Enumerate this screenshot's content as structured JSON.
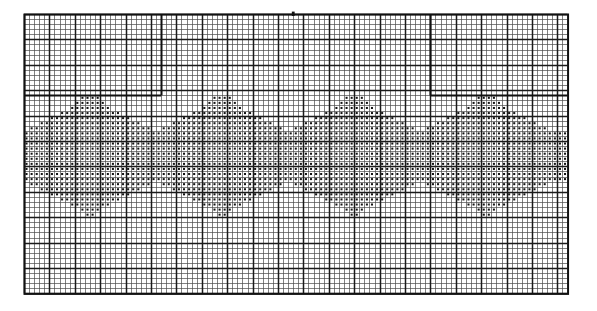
{
  "document": {
    "kind": "filet-crochet-pattern-chart",
    "title": "Filet Crochet Border Pattern Chart",
    "description": "Graph-paper chart showing a repeating scalloped arch border motif rendered as filled squares on a ruled grid."
  },
  "grid": {
    "origin_x": 24,
    "origin_y": 14,
    "cell_size": 5.08,
    "columns": 107,
    "rows": 55,
    "minor_line_color": "#4a4a4a",
    "minor_line_width": 0.7,
    "major_line_color": "#1a1a1a",
    "major_line_width": 1.5,
    "major_every": 5,
    "border_color": "#111111",
    "border_width": 2.0,
    "background_color": "#ffffff"
  },
  "symbols": {
    "filled_cell_color": "#141414",
    "filled_cell_inset": 0.3,
    "empty_cell_color": "#ffffff"
  },
  "guides": {
    "description": "Extra-heavy panel rules dividing the chart into repeat sections",
    "vertical_rules": [
      {
        "name": "panel-rule-left",
        "col": 27,
        "row_start": 0,
        "row_end": 16
      },
      {
        "name": "panel-rule-right",
        "col": 80,
        "row_start": 0,
        "row_end": 16
      }
    ],
    "horizontal_rules": [
      {
        "name": "panel-rule-top-left",
        "row": 16,
        "col_start": 0,
        "col_end": 27
      },
      {
        "name": "panel-rule-top-right",
        "row": 16,
        "col_start": 80,
        "col_end": 107
      }
    ],
    "center_tick": {
      "name": "center-mark",
      "col": 53,
      "row": 0
    }
  },
  "chart_data": {
    "type": "heatmap",
    "subtitle": "Repeating scalloped arch motif",
    "xlabel": "stitch column",
    "ylabel": "row",
    "grid": true,
    "legend": "none",
    "x": 107,
    "y": 55,
    "categories": [
      "empty",
      "filled"
    ],
    "values": [
      0,
      1
    ],
    "motif": {
      "repeat_width": 26,
      "repeats": 4,
      "repeat_start_col": 2,
      "top_row": 16,
      "bottom_row": 41
    },
    "pattern_rows": [
      {
        "row": 16,
        "spans": [
          [
            11,
            14
          ],
          [
            37,
            40
          ],
          [
            63,
            66
          ],
          [
            89,
            92
          ]
        ]
      },
      {
        "row": 17,
        "spans": [
          [
            10,
            15
          ],
          [
            36,
            41
          ],
          [
            62,
            67
          ],
          [
            88,
            93
          ]
        ]
      },
      {
        "row": 18,
        "spans": [
          [
            9,
            16
          ],
          [
            35,
            42
          ],
          [
            61,
            68
          ],
          [
            87,
            94
          ]
        ]
      },
      {
        "row": 19,
        "spans": [
          [
            7,
            18
          ],
          [
            33,
            44
          ],
          [
            59,
            70
          ],
          [
            85,
            96
          ]
        ]
      },
      {
        "row": 20,
        "spans": [
          [
            5,
            20
          ],
          [
            31,
            46
          ],
          [
            57,
            72
          ],
          [
            83,
            98
          ]
        ]
      },
      {
        "row": 21,
        "spans": [
          [
            3,
            22
          ],
          [
            29,
            48
          ],
          [
            55,
            74
          ],
          [
            81,
            100
          ]
        ]
      },
      {
        "row": 22,
        "spans": [
          [
            1,
            24
          ],
          [
            27,
            50
          ],
          [
            53,
            76
          ],
          [
            79,
            102
          ]
        ]
      },
      {
        "row": 23,
        "spans": [
          [
            0,
            106
          ]
        ]
      },
      {
        "row": 24,
        "spans": [
          [
            0,
            106
          ]
        ]
      },
      {
        "row": 25,
        "spans": [
          [
            0,
            106
          ]
        ]
      },
      {
        "row": 26,
        "spans": [
          [
            0,
            106
          ]
        ]
      },
      {
        "row": 27,
        "spans": [
          [
            0,
            106
          ]
        ]
      },
      {
        "row": 28,
        "spans": [
          [
            0,
            106
          ]
        ]
      },
      {
        "row": 29,
        "spans": [
          [
            0,
            106
          ]
        ]
      },
      {
        "row": 30,
        "spans": [
          [
            0,
            106
          ]
        ]
      },
      {
        "row": 31,
        "spans": [
          [
            0,
            106
          ]
        ]
      },
      {
        "row": 32,
        "spans": [
          [
            0,
            106
          ]
        ]
      },
      {
        "row": 33,
        "spans": [
          [
            1,
            24
          ],
          [
            27,
            50
          ],
          [
            53,
            76
          ],
          [
            79,
            102
          ]
        ]
      },
      {
        "row": 34,
        "spans": [
          [
            3,
            22
          ],
          [
            29,
            48
          ],
          [
            55,
            74
          ],
          [
            81,
            100
          ]
        ]
      },
      {
        "row": 35,
        "spans": [
          [
            5,
            20
          ],
          [
            31,
            46
          ],
          [
            57,
            72
          ],
          [
            83,
            98
          ]
        ]
      },
      {
        "row": 36,
        "spans": [
          [
            7,
            18
          ],
          [
            33,
            44
          ],
          [
            59,
            70
          ],
          [
            85,
            96
          ]
        ]
      },
      {
        "row": 37,
        "spans": [
          [
            9,
            16
          ],
          [
            35,
            42
          ],
          [
            61,
            68
          ],
          [
            87,
            94
          ]
        ]
      },
      {
        "row": 38,
        "spans": [
          [
            11,
            14
          ],
          [
            37,
            40
          ],
          [
            63,
            66
          ],
          [
            89,
            92
          ]
        ]
      },
      {
        "row": 39,
        "spans": [
          [
            12,
            13
          ],
          [
            38,
            39
          ],
          [
            64,
            65
          ],
          [
            90,
            91
          ]
        ]
      }
    ]
  }
}
